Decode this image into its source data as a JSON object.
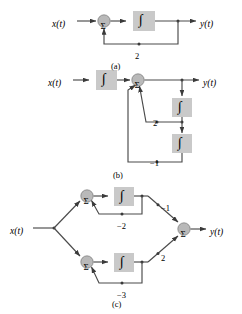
{
  "figure": {
    "background_color": "#ffffff",
    "block_fill": "#c9c9c9",
    "node_fill": "#b9b9b9",
    "wire_color": "#4a4a4a",
    "text_color": "#1a1a1a"
  },
  "symbols": {
    "summer": "Σ",
    "integrator": "∫",
    "input_signal": "x(t)",
    "output_signal": "y(t)"
  },
  "diagrams": [
    {
      "id": "a",
      "sublabel": "(a)",
      "input_label": "x(t)",
      "output_label": "y(t)",
      "summers": 1,
      "integrators": 1,
      "gains": [
        {
          "name": "feedback-gain",
          "value": "2"
        }
      ]
    },
    {
      "id": "b",
      "sublabel": "(b)",
      "input_label": "x(t)",
      "output_label": "y(t)",
      "summers": 1,
      "integrators": 3,
      "gains": [
        {
          "name": "feedback-gain-upper",
          "value": "2"
        },
        {
          "name": "feedback-gain-lower",
          "value": "−1"
        }
      ]
    },
    {
      "id": "c",
      "sublabel": "(c)",
      "input_label": "x(t)",
      "output_label": "y(t)",
      "summers": 3,
      "integrators": 2,
      "gains": [
        {
          "name": "feedback-gain-upper-branch",
          "value": "−2"
        },
        {
          "name": "feedback-gain-lower-branch",
          "value": "−3"
        },
        {
          "name": "output-gain-upper-branch",
          "value": "−1"
        },
        {
          "name": "output-gain-lower-branch",
          "value": "2"
        }
      ]
    }
  ]
}
